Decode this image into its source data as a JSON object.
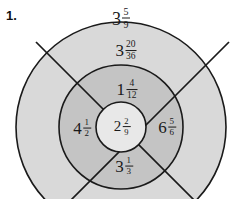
{
  "problem": {
    "number_label": "1."
  },
  "colors": {
    "page_background": "#ffffff",
    "outer_ring_fill": "#d9d9d9",
    "middle_ring_fill": "#c4c4c4",
    "center_fill": "#e8e8e8",
    "stroke": "#1a1a1a",
    "text": "#1a1a1a"
  },
  "figure": {
    "type": "concentric-circle-target",
    "center": {
      "x": 121,
      "y": 127
    },
    "radii": {
      "outer": 105,
      "middle": 62,
      "center": 25
    },
    "divider_count": 4,
    "divider_angles_deg": [
      45,
      135,
      225,
      315
    ],
    "labels": [
      {
        "id": "outside-top",
        "region": "outside-above-circle",
        "whole": "3",
        "numerator": "5",
        "denominator": "9",
        "text": "3 5/9",
        "x": 121,
        "y": 18
      },
      {
        "id": "outer-ring-top",
        "region": "outer-ring-top",
        "whole": "3",
        "numerator": "20",
        "denominator": "36",
        "text": "3 20/36",
        "x": 126,
        "y": 51
      },
      {
        "id": "middle-ring-top",
        "region": "middle-ring-top-quadrant",
        "whole": "1",
        "numerator": "4",
        "denominator": "12",
        "text": "1 4/12",
        "x": 127,
        "y": 90
      },
      {
        "id": "middle-ring-left",
        "region": "middle-ring-left-quadrant",
        "whole": "4",
        "numerator": "1",
        "denominator": "2",
        "text": "4 1/2",
        "x": 82,
        "y": 128
      },
      {
        "id": "center",
        "region": "center-circle",
        "whole": "2",
        "numerator": "2",
        "denominator": "9",
        "text": "2 2/9",
        "x": 122,
        "y": 127
      },
      {
        "id": "middle-ring-right",
        "region": "middle-ring-right-quadrant",
        "whole": "6",
        "numerator": "5",
        "denominator": "6",
        "text": "6 5/6",
        "x": 167,
        "y": 127
      },
      {
        "id": "middle-ring-bottom",
        "region": "middle-ring-bottom-quadrant",
        "whole": "3",
        "numerator": "1",
        "denominator": "3",
        "text": "3 1/3",
        "x": 124,
        "y": 166
      }
    ]
  }
}
